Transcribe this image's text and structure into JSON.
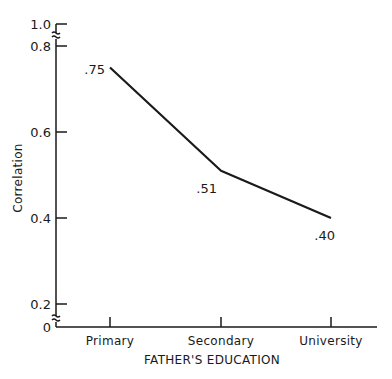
{
  "chart_data": {
    "type": "line",
    "title": "",
    "xlabel": "FATHER'S EDUCATION",
    "ylabel": "Correlation",
    "categories": [
      "Primary",
      "Secondary",
      "University"
    ],
    "series": [
      {
        "name": "Correlation",
        "values": [
          0.75,
          0.51,
          0.4
        ]
      }
    ],
    "point_labels": [
      ".75",
      ".51",
      ".40"
    ],
    "y_ticks": [
      {
        "value": 0,
        "label": "0"
      },
      {
        "value": 0.2,
        "label": "0.2"
      },
      {
        "value": 0.4,
        "label": "0.4"
      },
      {
        "value": 0.6,
        "label": "0.6"
      },
      {
        "value": 0.8,
        "label": "0.8"
      },
      {
        "value": 1.0,
        "label": "1.0"
      }
    ],
    "ylim": [
      0,
      1.0
    ],
    "axis_breaks": [
      "between 0 and 0.2",
      "between 0.8 and 1.0"
    ],
    "grid": false,
    "legend": "none",
    "line_color": "#1a1a1a"
  }
}
